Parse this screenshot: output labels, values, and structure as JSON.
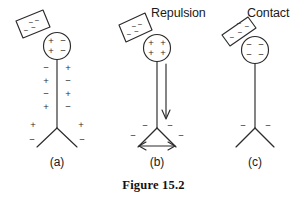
{
  "figure": {
    "caption": "Figure 15.2",
    "background_color": "#ffffff",
    "ink_color": "#2b2b2b",
    "panels": [
      {
        "id": "a",
        "label": "(a)",
        "annotation": "",
        "rod": {
          "charge_signs": [
            "−",
            "−",
            "−",
            "−"
          ],
          "touching_sphere": false
        },
        "sphere": {
          "charge_rows": [
            [
              "+",
              "−"
            ],
            [
              "+",
              "−"
            ]
          ]
        },
        "stem_charges": {
          "left_column": [
            "−",
            "+",
            "−",
            "+"
          ],
          "right_column": [
            "+",
            "−",
            "+",
            "−"
          ]
        },
        "base_charges": {
          "left_upper": "+",
          "right_upper": "+",
          "left_lower": "−",
          "right_lower": "−"
        },
        "arrows": []
      },
      {
        "id": "b",
        "label": "(b)",
        "annotation": "Repulsion",
        "rod": {
          "charge_signs": [
            "−",
            "−",
            "−",
            "−"
          ],
          "touching_sphere": false
        },
        "sphere": {
          "charge_rows": [
            [
              "+",
              "+"
            ],
            [
              "+",
              "+"
            ]
          ]
        },
        "stem_charges": {
          "left_column": [],
          "right_column": []
        },
        "base_charges": {
          "left_upper": "−",
          "right_upper": "−",
          "left_lower": "−",
          "right_lower": "−"
        },
        "arrows": [
          {
            "kind": "down-arrow",
            "direction": "down",
            "heads": 1
          },
          {
            "kind": "spread-arrow",
            "direction": "horizontal",
            "heads": 2
          }
        ]
      },
      {
        "id": "c",
        "label": "(c)",
        "annotation": "Contact",
        "rod": {
          "charge_signs": [
            "−",
            "−",
            "−",
            "−"
          ],
          "touching_sphere": true
        },
        "sphere": {
          "charge_rows": [
            [
              "−",
              "−"
            ],
            [
              "−",
              "−"
            ]
          ]
        },
        "stem_charges": {
          "left_column": [],
          "right_column": []
        },
        "base_charges": {
          "left_upper": "−",
          "right_upper": "−",
          "left_lower": "",
          "right_lower": ""
        },
        "arrows": []
      }
    ]
  }
}
